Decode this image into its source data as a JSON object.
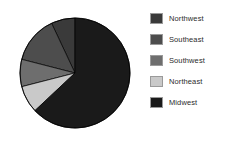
{
  "chart_data": {
    "type": "pie",
    "title": "",
    "labels": [
      "Northwest",
      "Southeast",
      "Southwest",
      "Northeast",
      "Midwest"
    ],
    "values": [
      7,
      14,
      8,
      8,
      63
    ],
    "colors": [
      "#3a3a3a",
      "#4d4d4d",
      "#6e6e6e",
      "#c9c9c9",
      "#1a1a1a"
    ],
    "start_angle_deg": 90,
    "direction": "counterclockwise",
    "legend_position": "right",
    "grid": false,
    "xlabel": "",
    "ylabel": ""
  },
  "legend": {
    "items": [
      {
        "label": "Northwest",
        "color": "#3a3a3a",
        "swatch_name": "legend-swatch-northwest"
      },
      {
        "label": "Southeast",
        "color": "#4d4d4d",
        "swatch_name": "legend-swatch-southeast"
      },
      {
        "label": "Southwest",
        "color": "#6e6e6e",
        "swatch_name": "legend-swatch-southwest"
      },
      {
        "label": "Northeast",
        "color": "#c9c9c9",
        "swatch_name": "legend-swatch-northeast"
      },
      {
        "label": "Midwest",
        "color": "#1a1a1a",
        "swatch_name": "legend-swatch-midwest"
      }
    ]
  },
  "pie": {
    "center_x": 75,
    "center_y": 73,
    "radius": 55,
    "outline_color": "#000000"
  }
}
